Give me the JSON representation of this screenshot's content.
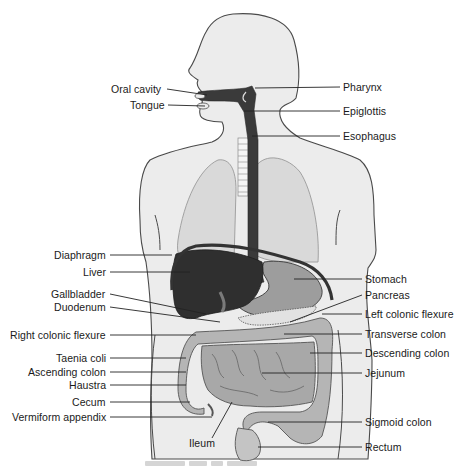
{
  "figure": {
    "caption_visible": false
  },
  "colors": {
    "body_fill": "#ececec",
    "body_outline": "#4a4a4a",
    "dark_organ": "#3a3a3a",
    "liver": "#2f2f2f",
    "lung": "#d9d9d9",
    "intestine": "#b5b5b5",
    "stomach": "#9d9d9d",
    "leader_line": "#222222",
    "text": "#1a1a1a"
  },
  "labels_left": [
    {
      "id": "oral-cavity",
      "text": "Oral cavity",
      "x": 111,
      "y": 83
    },
    {
      "id": "tongue",
      "text": "Tongue",
      "x": 130,
      "y": 99
    },
    {
      "id": "diaphragm",
      "text": "Diaphragm",
      "x": 54,
      "y": 249
    },
    {
      "id": "liver",
      "text": "Liver",
      "x": 83,
      "y": 266
    },
    {
      "id": "gallbladder",
      "text": "Gallbladder",
      "x": 51,
      "y": 288
    },
    {
      "id": "duodenum",
      "text": "Duodenum",
      "x": 54,
      "y": 301
    },
    {
      "id": "right-colonic-flexure",
      "text": "Right colonic flexure",
      "x": 10,
      "y": 329
    },
    {
      "id": "taenia-coli",
      "text": "Taenia coli",
      "x": 56,
      "y": 352
    },
    {
      "id": "ascending-colon",
      "text": "Ascending colon",
      "x": 28,
      "y": 366
    },
    {
      "id": "haustra",
      "text": "Haustra",
      "x": 69,
      "y": 379
    },
    {
      "id": "cecum",
      "text": "Cecum",
      "x": 72,
      "y": 396
    },
    {
      "id": "vermiform-appendix",
      "text": "Vermiform appendix",
      "x": 12,
      "y": 411
    }
  ],
  "labels_right": [
    {
      "id": "pharynx",
      "text": "Pharynx",
      "x": 343,
      "y": 81
    },
    {
      "id": "epiglottis",
      "text": "Epiglottis",
      "x": 343,
      "y": 105
    },
    {
      "id": "esophagus",
      "text": "Esophagus",
      "x": 343,
      "y": 130
    },
    {
      "id": "stomach",
      "text": "Stomach",
      "x": 365,
      "y": 273
    },
    {
      "id": "pancreas",
      "text": "Pancreas",
      "x": 365,
      "y": 289
    },
    {
      "id": "left-colonic-flexure",
      "text": "Left colonic flexure",
      "x": 365,
      "y": 308
    },
    {
      "id": "transverse-colon",
      "text": "Transverse colon",
      "x": 365,
      "y": 328
    },
    {
      "id": "descending-colon",
      "text": "Descending colon",
      "x": 365,
      "y": 347
    },
    {
      "id": "jejunum",
      "text": "Jejunum",
      "x": 365,
      "y": 367
    },
    {
      "id": "sigmoid-colon",
      "text": "Sigmoid colon",
      "x": 365,
      "y": 416
    },
    {
      "id": "rectum",
      "text": "Rectum",
      "x": 365,
      "y": 441
    }
  ],
  "labels_bottom": [
    {
      "id": "ileum",
      "text": "Ileum",
      "x": 189,
      "y": 437
    }
  ]
}
